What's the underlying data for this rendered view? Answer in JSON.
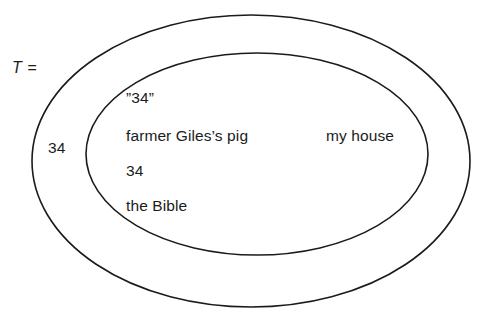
{
  "figure": {
    "kind": "euler-diagram",
    "background_color": "#ffffff",
    "stroke_color": "#1b1b1b",
    "text_color": "#1b1b1b"
  },
  "set_label": {
    "name": "T =",
    "text": "T ="
  },
  "outer_region": {
    "name": "outer-ring",
    "members": [
      {
        "id": "outer-34",
        "text": "34"
      }
    ]
  },
  "inner_region": {
    "name": "inner-ellipse",
    "members": [
      {
        "id": "quoted-34",
        "text": "”34”"
      },
      {
        "id": "farmer-giles-pig",
        "text": "farmer Giles’s pig"
      },
      {
        "id": "my-house",
        "text": "my house"
      },
      {
        "id": "inner-34",
        "text": "34"
      },
      {
        "id": "the-bible",
        "text": "the Bible"
      }
    ]
  },
  "shapes": {
    "outer_ellipse": {
      "cx": 251,
      "cy": 161,
      "rx": 219,
      "ry": 146,
      "stroke_width": 1.6
    },
    "inner_ellipse": {
      "cx": 257,
      "cy": 154,
      "rx": 171,
      "ry": 101,
      "stroke_width": 1.6
    }
  }
}
